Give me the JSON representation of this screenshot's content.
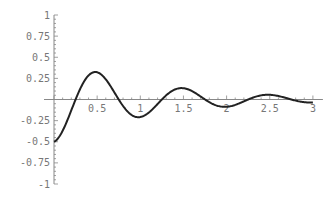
{
  "chart_data": {
    "type": "line",
    "title": "",
    "xlabel": "",
    "ylabel": "",
    "xlim": [
      0,
      3
    ],
    "ylim": [
      -1,
      1
    ],
    "grid": false,
    "x_ticks": [
      "0.5",
      "1",
      "1.5",
      "2",
      "2.5",
      "3"
    ],
    "y_ticks": [
      "1",
      "0.75",
      "0.5",
      "0.25",
      "-0.25",
      "-0.5",
      "-0.75",
      "-1"
    ],
    "series": [
      {
        "name": "damped oscillation",
        "x": [
          0,
          0.25,
          0.55,
          0.8,
          1.05,
          1.3,
          1.55,
          1.8,
          2.05,
          2.3,
          2.55,
          2.8,
          3.0
        ],
        "values": [
          -0.5,
          -0.1,
          0.31,
          0.0,
          -0.2,
          0.0,
          0.12,
          0.0,
          -0.07,
          0.0,
          0.05,
          0.0,
          -0.03
        ]
      }
    ]
  }
}
